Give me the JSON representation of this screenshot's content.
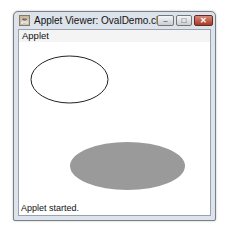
{
  "window": {
    "title": "Applet Viewer: OvalDemo.class",
    "icon": "java-applet-icon",
    "controls": {
      "minimize": "–",
      "maximize": "□",
      "close": "✕"
    }
  },
  "menu": {
    "items": [
      {
        "label": "Applet"
      }
    ]
  },
  "canvas": {
    "shapes": [
      {
        "type": "oval-outline",
        "cx": 69.5,
        "cy": 79.5,
        "rx": 38.5,
        "ry": 23.5,
        "stroke": "#222222",
        "fill": "none"
      },
      {
        "type": "oval-filled",
        "cx": 127.5,
        "cy": 166,
        "rx": 57.5,
        "ry": 24,
        "fill": "#9a9a9a"
      }
    ]
  },
  "status": {
    "text": "Applet started."
  }
}
